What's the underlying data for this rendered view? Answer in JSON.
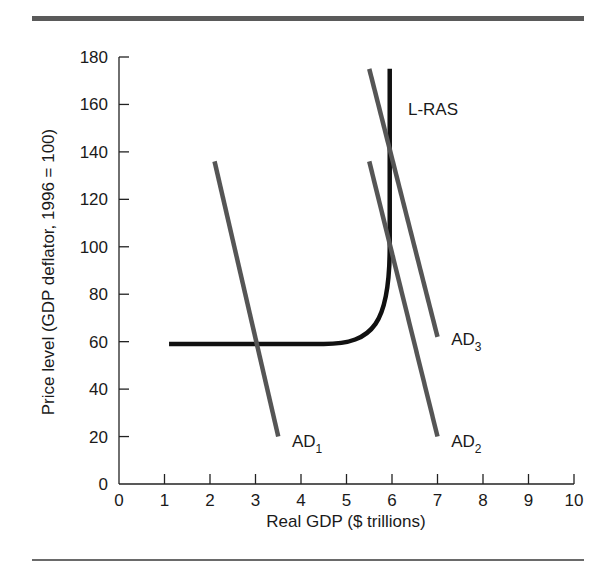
{
  "chart_data": {
    "type": "line",
    "title": "",
    "xlabel": "Real GDP ($ trillions)",
    "ylabel": "Price level (GDP deflator, 1996 = 100)",
    "xlim": [
      0,
      10
    ],
    "ylim": [
      0,
      180
    ],
    "x_ticks": [
      "0",
      "1",
      "2",
      "3",
      "4",
      "5",
      "6",
      "7",
      "8",
      "9",
      "10"
    ],
    "y_ticks": [
      "0",
      "20",
      "40",
      "60",
      "80",
      "100",
      "120",
      "140",
      "160",
      "180"
    ],
    "grid": false,
    "legend": "none (curves labeled directly)",
    "series": [
      {
        "name": "L-RAS",
        "label": "L-RAS",
        "color": "#111111",
        "points": [
          [
            1.1,
            59
          ],
          [
            2.0,
            59
          ],
          [
            3.0,
            59
          ],
          [
            4.0,
            59
          ],
          [
            4.5,
            59.5
          ],
          [
            5.0,
            62
          ],
          [
            5.4,
            68
          ],
          [
            5.7,
            78
          ],
          [
            5.85,
            90
          ],
          [
            5.93,
            105
          ],
          [
            5.95,
            120
          ],
          [
            5.95,
            150
          ],
          [
            5.95,
            175
          ]
        ]
      },
      {
        "name": "AD1",
        "label": "AD",
        "subscript": "1",
        "color": "#555555",
        "points": [
          [
            2.1,
            136
          ],
          [
            3.5,
            20
          ]
        ]
      },
      {
        "name": "AD2",
        "label": "AD",
        "subscript": "2",
        "color": "#555555",
        "points": [
          [
            5.5,
            136
          ],
          [
            7.0,
            20
          ]
        ]
      },
      {
        "name": "AD3",
        "label": "AD",
        "subscript": "3",
        "color": "#555555",
        "points": [
          [
            5.5,
            175
          ],
          [
            7.0,
            62
          ]
        ]
      }
    ],
    "annotations": [
      {
        "text": "L-RAS",
        "x": 6.35,
        "y": 158
      },
      {
        "text": "AD1",
        "x": 3.8,
        "y": 18
      },
      {
        "text": "AD2",
        "x": 7.3,
        "y": 18
      },
      {
        "text": "AD3",
        "x": 7.3,
        "y": 61
      }
    ]
  }
}
